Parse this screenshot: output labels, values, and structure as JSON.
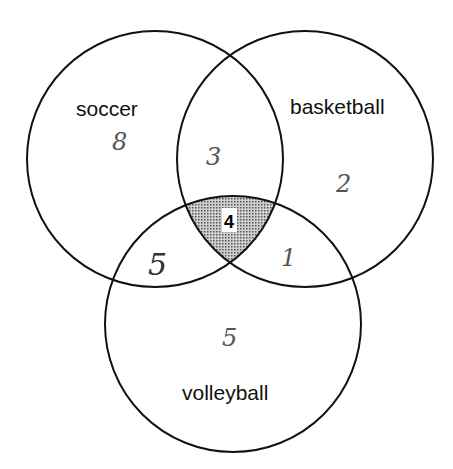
{
  "diagram": {
    "type": "venn",
    "sets": [
      {
        "name": "soccer",
        "label": "soccer"
      },
      {
        "name": "basketball",
        "label": "basketball"
      },
      {
        "name": "volleyball",
        "label": "volleyball"
      }
    ],
    "regions": {
      "soccer_only": "8",
      "basketball_only": "2",
      "volleyball_only": "5",
      "soccer_basketball": "3",
      "soccer_volleyball": "5",
      "basketball_volleyball": "1",
      "all_three": "4"
    },
    "highlighted_region": "all_three",
    "colors": {
      "outline": "#111111",
      "shading": "#b0b0b0",
      "background": "#ffffff"
    }
  }
}
